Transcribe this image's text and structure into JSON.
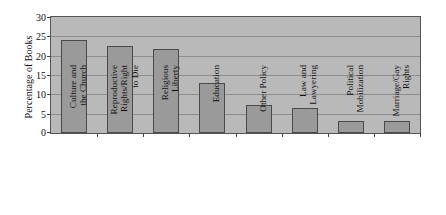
{
  "chart_data": {
    "type": "bar",
    "title": "",
    "xlabel": "",
    "ylabel": "Percentage of Books",
    "ylim": [
      0,
      30
    ],
    "ytick_labels": [
      "0",
      "5",
      "10",
      "15",
      "20",
      "25",
      "30"
    ],
    "ytick_values": [
      0,
      5,
      10,
      15,
      20,
      25,
      30
    ],
    "grid": true,
    "legend": "none",
    "categories": [
      "Culture and the Church",
      "Reproductive Rights/Right to Die",
      "Religious Liberty",
      "Education",
      "Other Policy",
      "Law and Lawyering",
      "Political Mobilization",
      "Marriage/Gay Rights"
    ],
    "category_lines": [
      [
        "Culture and",
        "the Church"
      ],
      [
        "Reproductive",
        "Rights/Right",
        "to Die"
      ],
      [
        "Religious",
        "Liberty"
      ],
      [
        "Education"
      ],
      [
        "Other Policy"
      ],
      [
        "Law and",
        "Lawyering"
      ],
      [
        "Political",
        "Mobilization"
      ],
      [
        "Marriage/Gay",
        "Rights"
      ]
    ],
    "values": [
      24.1,
      22.6,
      21.8,
      13.0,
      7.3,
      6.4,
      3.2,
      3.2
    ],
    "colors": {
      "bar_fill": "#9a9a9a",
      "bar_edge": "#4a4a4a",
      "plot_background": "#b9b9b9",
      "gridline": "#8d8d8d",
      "axis": "#555555",
      "text": "#111111",
      "figure_background": "#ffffff"
    }
  }
}
